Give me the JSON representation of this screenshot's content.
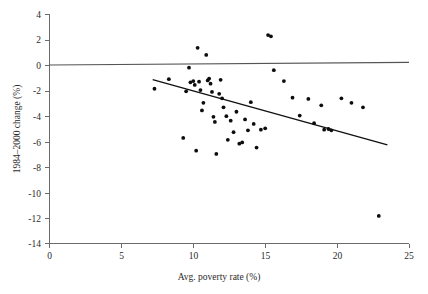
{
  "chart_data": {
    "type": "scatter",
    "title": "",
    "xlabel": "Avg. poverty rate (%)",
    "ylabel": "1984–2000 change (%)",
    "xlim": [
      0,
      25
    ],
    "ylim": [
      -14,
      4
    ],
    "xticks": [
      0,
      5,
      10,
      15,
      20,
      25
    ],
    "yticks": [
      4,
      2,
      0,
      -2,
      -4,
      -6,
      -8,
      -10,
      -12,
      -14
    ],
    "xtick_labels": [
      "0",
      "5",
      "10",
      "15",
      "20",
      "25"
    ],
    "ytick_labels": [
      "4",
      "2",
      "0",
      "-2",
      "-4",
      "-6",
      "-8",
      "-10",
      "-12",
      "-14"
    ],
    "grid": false,
    "legend": null,
    "marker": "filled-circle",
    "marker_color": "#0d0d0d",
    "series": [
      {
        "name": "States",
        "points": [
          [
            7.3,
            -1.85
          ],
          [
            8.3,
            -1.1
          ],
          [
            9.3,
            -5.7
          ],
          [
            9.5,
            -2.05
          ],
          [
            9.7,
            -0.2
          ],
          [
            9.8,
            -1.35
          ],
          [
            10.0,
            -1.25
          ],
          [
            10.1,
            -1.55
          ],
          [
            10.2,
            -6.7
          ],
          [
            10.3,
            1.35
          ],
          [
            10.4,
            -1.3
          ],
          [
            10.5,
            -1.95
          ],
          [
            10.6,
            -3.55
          ],
          [
            10.7,
            -2.95
          ],
          [
            10.9,
            0.8
          ],
          [
            11.0,
            -1.2
          ],
          [
            11.1,
            -1.05
          ],
          [
            11.2,
            -1.45
          ],
          [
            11.3,
            -2.1
          ],
          [
            11.4,
            -4.05
          ],
          [
            11.5,
            -4.45
          ],
          [
            11.6,
            -6.95
          ],
          [
            11.8,
            -2.25
          ],
          [
            11.9,
            -1.15
          ],
          [
            12.0,
            -2.6
          ],
          [
            12.1,
            -3.3
          ],
          [
            12.3,
            -4.0
          ],
          [
            12.4,
            -5.85
          ],
          [
            12.6,
            -4.35
          ],
          [
            12.8,
            -5.25
          ],
          [
            13.0,
            -3.65
          ],
          [
            13.2,
            -6.15
          ],
          [
            13.4,
            -6.05
          ],
          [
            13.6,
            -4.25
          ],
          [
            13.8,
            -5.1
          ],
          [
            14.0,
            -2.9
          ],
          [
            14.2,
            -4.6
          ],
          [
            14.4,
            -6.45
          ],
          [
            14.7,
            -5.05
          ],
          [
            15.0,
            -4.95
          ],
          [
            15.2,
            2.35
          ],
          [
            15.4,
            2.25
          ],
          [
            15.6,
            -0.4
          ],
          [
            16.3,
            -1.25
          ],
          [
            16.9,
            -2.55
          ],
          [
            17.4,
            -3.95
          ],
          [
            18.0,
            -2.65
          ],
          [
            18.4,
            -4.55
          ],
          [
            18.9,
            -3.15
          ],
          [
            19.1,
            -5.05
          ],
          [
            19.4,
            -5.0
          ],
          [
            19.6,
            -5.1
          ],
          [
            20.3,
            -2.6
          ],
          [
            21.0,
            -2.95
          ],
          [
            21.8,
            -3.3
          ],
          [
            22.9,
            -11.8
          ]
        ]
      }
    ],
    "reference_lines": [
      {
        "name": "zero-line",
        "orientation": "horizontal",
        "value": 0,
        "from": [
          0,
          0.05
        ],
        "to": [
          25,
          0.25
        ],
        "color": "#555555"
      }
    ],
    "trendline": {
      "name": "regression-line",
      "from": [
        7.2,
        -1.1
      ],
      "to": [
        23.5,
        -6.2
      ],
      "color": "#111111",
      "slope": -0.313,
      "intercept": 1.15
    }
  }
}
